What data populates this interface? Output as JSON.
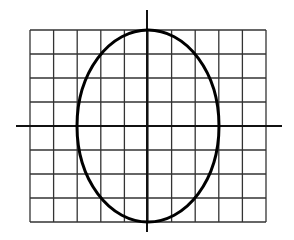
{
  "diagram": {
    "type": "ellipse-on-grid",
    "colors": {
      "background": "#ffffff",
      "grid": "#333333",
      "axes": "#111111",
      "curve": "#000000"
    },
    "grid": {
      "left": 30,
      "top": 30,
      "right": 266,
      "bottom": 222,
      "columns": 10,
      "rows": 8
    },
    "axes": {
      "x_axis": {
        "y": 126,
        "x1": 16,
        "x2": 282
      },
      "y_axis": {
        "x": 147,
        "y1": 10,
        "y2": 232
      }
    },
    "ellipse": {
      "cx": 148,
      "cy": 126,
      "rx": 71,
      "ry": 96
    }
  }
}
